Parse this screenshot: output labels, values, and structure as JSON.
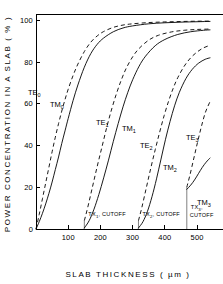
{
  "chart_data": {
    "type": "line",
    "title": "",
    "xlabel": "SLAB  THICKNESS  ( µm )",
    "ylabel": "POWER  CONCENTRATION  IN  A  SLAB ( % )",
    "xlim": [
      0,
      540
    ],
    "ylim": [
      0,
      103
    ],
    "xticks": [
      100,
      200,
      300,
      400,
      500
    ],
    "xtick_labels": [
      "100",
      "200",
      "300",
      "400",
      "500"
    ],
    "yticks": [
      0,
      20,
      40,
      60,
      80,
      100
    ],
    "ytick_labels": [
      "0",
      "20",
      "40",
      "60",
      "80",
      "100"
    ],
    "grid": false,
    "legend": "none",
    "xunit": "µm",
    "yunit": "%",
    "series": [
      {
        "name": "TE0",
        "label": "TE",
        "subscript": "0",
        "style": "dashed",
        "cutoff": 0,
        "x": [
          0,
          10,
          20,
          30,
          40,
          50,
          60,
          70,
          80,
          90,
          100,
          115,
          130,
          150,
          170,
          190,
          210,
          240,
          270,
          300,
          350,
          400,
          450,
          500,
          540
        ],
        "y": [
          0,
          7,
          14.5,
          22,
          29.5,
          37,
          44,
          50.5,
          56.5,
          62,
          67,
          73.5,
          79,
          85,
          89.5,
          92.5,
          94.6,
          96.6,
          97.7,
          98.3,
          98.9,
          99.2,
          99.4,
          99.55,
          99.6
        ]
      },
      {
        "name": "TM0",
        "label": "TM",
        "subscript": "0",
        "style": "solid",
        "cutoff": 0,
        "x": [
          0,
          10,
          20,
          30,
          40,
          50,
          60,
          70,
          80,
          90,
          100,
          115,
          130,
          150,
          170,
          190,
          210,
          240,
          270,
          300,
          350,
          400,
          450,
          500,
          540
        ],
        "y": [
          0,
          3.5,
          7.5,
          12,
          17,
          22.5,
          28.5,
          34.5,
          41,
          47,
          53,
          61.5,
          69,
          77.5,
          84,
          88.5,
          91.5,
          94.5,
          96.3,
          97.3,
          98.3,
          98.8,
          99.1,
          99.3,
          99.45
        ]
      },
      {
        "name": "TE1",
        "label": "TE",
        "subscript": "1",
        "style": "dashed",
        "cutoff": 150,
        "x": [
          150,
          160,
          175,
          190,
          205,
          220,
          235,
          250,
          265,
          280,
          300,
          320,
          350,
          380,
          420,
          460,
          500,
          540
        ],
        "y": [
          4,
          10,
          20,
          30,
          39.5,
          49,
          57.5,
          65,
          71.5,
          77,
          82.5,
          86.5,
          90.5,
          92.8,
          94.4,
          95.2,
          95.6,
          95.8
        ]
      },
      {
        "name": "TM1",
        "label": "TM",
        "subscript": "1",
        "style": "solid",
        "cutoff": 150,
        "x": [
          150,
          165,
          180,
          195,
          210,
          225,
          240,
          255,
          270,
          285,
          300,
          320,
          340,
          370,
          400,
          440,
          480,
          520,
          540
        ],
        "y": [
          0.5,
          4,
          9.5,
          16.5,
          24.5,
          33,
          42,
          50.5,
          58.5,
          65.5,
          71.5,
          78,
          82.8,
          87.8,
          90.8,
          93.2,
          94.5,
          95.2,
          95.4
        ]
      },
      {
        "name": "TE2",
        "label": "TE",
        "subscript": "2",
        "style": "dashed",
        "cutoff": 318,
        "x": [
          318,
          328,
          342,
          356,
          370,
          384,
          398,
          412,
          426,
          440,
          460,
          480,
          500,
          520,
          540
        ],
        "y": [
          4,
          10,
          19.5,
          29,
          38,
          46.5,
          54.5,
          61.5,
          67.5,
          72.5,
          78,
          82,
          84.8,
          86.8,
          88
        ]
      },
      {
        "name": "TM2",
        "label": "TM",
        "subscript": "2",
        "style": "solid",
        "cutoff": 318,
        "x": [
          318,
          332,
          346,
          360,
          374,
          388,
          402,
          416,
          430,
          445,
          465,
          485,
          505,
          525,
          540
        ],
        "y": [
          0.5,
          3.5,
          8.5,
          15.5,
          24,
          33.5,
          43,
          51.5,
          59,
          65.5,
          72,
          76.5,
          79.5,
          81.3,
          82
        ]
      },
      {
        "name": "TE3",
        "label": "TE",
        "subscript": "3",
        "style": "dashed",
        "cutoff": 468,
        "x": [
          468,
          478,
          490,
          502,
          514,
          526,
          540
        ],
        "y": [
          20,
          26,
          34,
          42,
          49.5,
          56,
          61
        ]
      },
      {
        "name": "TM3",
        "label": "TM",
        "subscript": "3",
        "style": "solid",
        "cutoff": 468,
        "x": [
          468,
          480,
          492,
          504,
          516,
          528,
          540
        ],
        "y": [
          19,
          21,
          23.5,
          26.5,
          29.5,
          32,
          34
        ]
      }
    ],
    "curve_labels": [
      {
        "name": "TE0",
        "label": "TE",
        "subscript": "0",
        "x": 28,
        "y": 95
      },
      {
        "name": "TM0",
        "label": "TM",
        "subscript": "0",
        "x": 50,
        "y": 107
      },
      {
        "name": "TE1",
        "label": "TE",
        "subscript": "1",
        "x": 96,
        "y": 125
      },
      {
        "name": "TM1",
        "label": "TM",
        "subscript": "1",
        "x": 122,
        "y": 131
      },
      {
        "name": "TE2",
        "label": "TE",
        "subscript": "2",
        "x": 140,
        "y": 148
      },
      {
        "name": "TM2",
        "label": "TM",
        "subscript": "2",
        "x": 163,
        "y": 170
      },
      {
        "name": "TE3",
        "label": "TE",
        "subscript": "3",
        "x": 186,
        "y": 140
      },
      {
        "name": "TM3",
        "label": "TM",
        "subscript": "3",
        "x": 197,
        "y": 205
      }
    ],
    "cutoff_markers": [
      {
        "name": "TX1",
        "label": "TX",
        "subscript": "1",
        "suffix": ", CUTOFF",
        "x_value": 150,
        "lines": 1
      },
      {
        "name": "TX2",
        "label": "TX",
        "subscript": "2",
        "suffix": ", CUTOFF",
        "x_value": 318,
        "lines": 1
      },
      {
        "name": "TX3",
        "label": "TX",
        "subscript": "3",
        "suffix": ",",
        "suffix2": "CUTOFF",
        "x_value": 468,
        "lines": 2
      }
    ],
    "colors": {
      "axis": "#000000",
      "curve": "#000000",
      "background": "#ffffff"
    }
  }
}
